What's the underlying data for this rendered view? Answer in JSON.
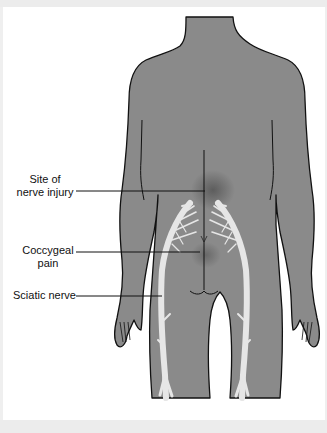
{
  "diagram": {
    "type": "anatomical illustration",
    "colors": {
      "body_fill": "#8a8a8a",
      "outline": "#111111",
      "nerve": "#e6e6e6",
      "background": "#ffffff",
      "frame": "#ececec"
    },
    "labels": [
      {
        "id": "site",
        "line1": "Site of",
        "line2": "nerve injury"
      },
      {
        "id": "coccygeal",
        "line1": "Coccygeal",
        "line2": "pain"
      },
      {
        "id": "sciatic",
        "line1": "Sciatic nerve"
      }
    ]
  }
}
